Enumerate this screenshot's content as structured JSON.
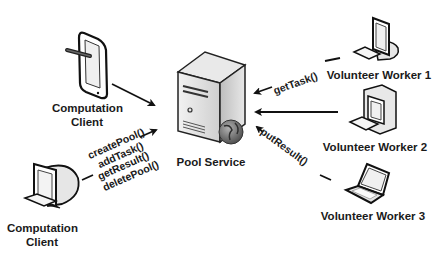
{
  "nodes": {
    "client_tablet": {
      "label_line1": "Computation",
      "label_line2": "Client"
    },
    "client_desktop": {
      "label_line1": "Computation",
      "label_line2": "Client"
    },
    "server": {
      "label": "Pool Service"
    },
    "worker1": {
      "label": "Volunteer Worker 1"
    },
    "worker2": {
      "label": "Volunteer Worker 2"
    },
    "worker3": {
      "label": "Volunteer Worker 3"
    }
  },
  "edges": {
    "client_calls": [
      "createPool()",
      "addTask()",
      "getResult()",
      "deletePool()"
    ],
    "worker1_call": "getTask()",
    "worker3_call": "putResult()"
  },
  "colors": {
    "line": "#111111",
    "server_body": "#d9d9d9",
    "globe": "#6a6a6a"
  }
}
